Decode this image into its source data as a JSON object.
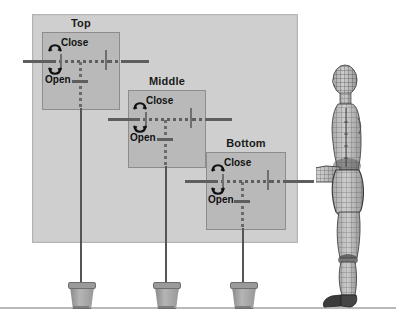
{
  "diagram": {
    "title_hidden": "",
    "background_color": "#ffffff",
    "backboard_color": "#cfcfcf",
    "board_color": "#b9b9b9",
    "bar_color": "#5e5e5e",
    "ground_color": "#b9b9b9"
  },
  "stations": [
    {
      "id": "top",
      "title": "Top",
      "close_label": "Close",
      "open_label": "Open",
      "close_icon": "arc-arrow-up-icon",
      "open_icon": "arc-arrow-down-icon"
    },
    {
      "id": "middle",
      "title": "Middle",
      "close_label": "Close",
      "open_label": "Open",
      "close_icon": "arc-arrow-up-icon",
      "open_icon": "arc-arrow-down-icon"
    },
    {
      "id": "bottom",
      "title": "Bottom",
      "close_label": "Close",
      "open_label": "Open",
      "close_icon": "arc-arrow-up-icon",
      "open_icon": "arc-arrow-down-icon"
    }
  ],
  "buckets": [
    {
      "id": "bucket-top",
      "name": "weighted-base-bucket"
    },
    {
      "id": "bucket-middle",
      "name": "weighted-base-bucket"
    },
    {
      "id": "bucket-bottom",
      "name": "weighted-base-bucket"
    }
  ],
  "figure": {
    "name": "human-wireframe-mannequin",
    "pose": "standing-profile-arm-extended"
  }
}
